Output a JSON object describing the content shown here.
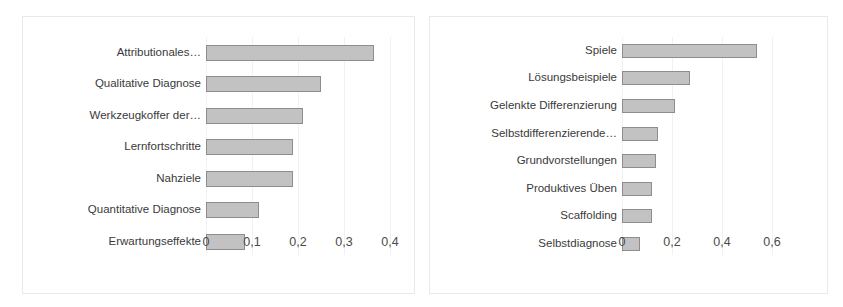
{
  "chart_data": [
    {
      "type": "bar",
      "orientation": "horizontal",
      "title": "",
      "subtitle": "",
      "xlabel": "",
      "ylabel": "",
      "xlim": [
        0,
        0.4
      ],
      "xticks": [
        "0",
        "0,1",
        "0,2",
        "0,3",
        "0,4"
      ],
      "xtick_values": [
        0,
        0.1,
        0.2,
        0.3,
        0.4
      ],
      "grid": true,
      "grid_axis": "x",
      "legend": false,
      "legend_position": "none",
      "bar_fill": "#c2c2c2",
      "bar_stroke": "#8d8d8d",
      "categories": [
        "Attributionales…",
        "Qualitative Diagnose",
        "Werkzeugkoffer der…",
        "Lernfortschritte",
        "Nahziele",
        "Quantitative Diagnose",
        "Erwartungseffekte"
      ],
      "values": [
        0.365,
        0.25,
        0.21,
        0.19,
        0.19,
        0.115,
        0.085
      ]
    },
    {
      "type": "bar",
      "orientation": "horizontal",
      "title": "",
      "subtitle": "",
      "xlabel": "",
      "ylabel": "",
      "xlim": [
        0,
        0.64
      ],
      "xticks": [
        "0",
        "0,2",
        "0,4",
        "0,6"
      ],
      "xtick_values": [
        0,
        0.2,
        0.4,
        0.6
      ],
      "grid": true,
      "grid_axis": "x",
      "legend": false,
      "legend_position": "none",
      "bar_fill": "#c2c2c2",
      "bar_stroke": "#8d8d8d",
      "categories": [
        "Spiele",
        "Lösungsbeispiele",
        "Gelenkte Differenzierung",
        "Selbstdifferenzierende…",
        "Grundvorstellungen",
        "Produktives Üben",
        "Scaffolding",
        "Selbstdiagnose"
      ],
      "values": [
        0.54,
        0.27,
        0.21,
        0.145,
        0.135,
        0.12,
        0.12,
        0.07
      ]
    }
  ]
}
